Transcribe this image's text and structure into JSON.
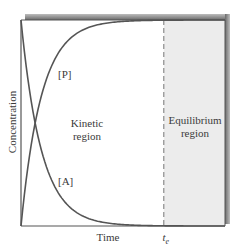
{
  "chart_data": {
    "type": "line",
    "title": "",
    "xlabel": "Time",
    "ylabel": "Concentration",
    "x_marker": {
      "label": "t",
      "subscript": "e",
      "value": 0.7
    },
    "xlim": [
      0,
      1
    ],
    "ylim": [
      0,
      1
    ],
    "grid": false,
    "legend": "none",
    "series": [
      {
        "name": "[P]",
        "label": "[P]",
        "description": "product concentration rising from 0 to plateau",
        "x": [
          0,
          0.05,
          0.1,
          0.15,
          0.2,
          0.3,
          0.4,
          0.5,
          0.6,
          0.7,
          1.0
        ],
        "values": [
          0,
          0.39,
          0.63,
          0.78,
          0.86,
          0.95,
          0.98,
          0.99,
          1.0,
          1.0,
          1.0
        ],
        "color": "#555555"
      },
      {
        "name": "[A]",
        "label": "[A]",
        "description": "reactant concentration decaying from max to 0",
        "x": [
          0,
          0.05,
          0.1,
          0.15,
          0.2,
          0.3,
          0.4,
          0.5,
          0.6,
          0.7,
          1.0
        ],
        "values": [
          1.0,
          0.61,
          0.37,
          0.22,
          0.14,
          0.05,
          0.02,
          0.01,
          0.0,
          0.0,
          0.0
        ],
        "color": "#555555"
      }
    ],
    "regions": [
      {
        "name": "kinetic",
        "label_line1": "Kinetic",
        "label_line2": "region",
        "x_range": [
          0,
          0.7
        ],
        "fill": "#ffffff"
      },
      {
        "name": "equilibrium",
        "label_line1": "Equilibrium",
        "label_line2": "region",
        "x_range": [
          0.7,
          1.0
        ],
        "fill": "#ececec"
      }
    ],
    "colors": {
      "frame": "#555555",
      "shadow": "#8a8a8a",
      "dashed_line": "#777777",
      "text": "#3a3a3a"
    }
  }
}
